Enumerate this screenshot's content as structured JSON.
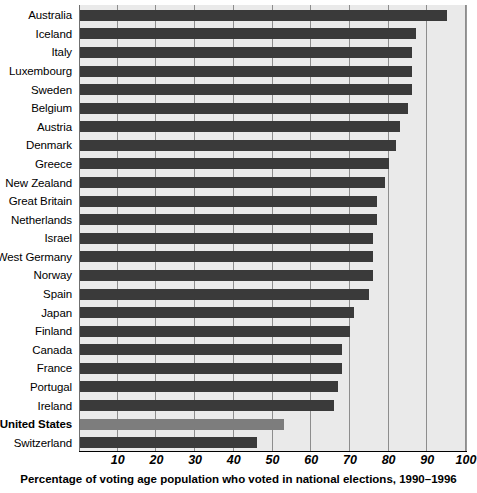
{
  "chart_data": {
    "type": "bar",
    "orientation": "horizontal",
    "title": "",
    "caption": "Percentage of voting age population who voted in national elections, 1990–1996",
    "xlabel": "Percentage of voting age population who voted in national elections, 1990–1996",
    "ylabel": "",
    "xlim": [
      0,
      100
    ],
    "xticks": [
      10,
      20,
      30,
      40,
      50,
      60,
      70,
      80,
      90,
      100
    ],
    "xtick_labels": [
      "10",
      "20",
      "30",
      "40",
      "50",
      "60",
      "70",
      "80",
      "90",
      "100"
    ],
    "grid": "vertical",
    "legend": "none",
    "highlight_category": "United States",
    "categories": [
      "Australia",
      "Iceland",
      "Italy",
      "Luxembourg",
      "Sweden",
      "Belgium",
      "Austria",
      "Denmark",
      "Greece",
      "New Zealand",
      "Great Britain",
      "Netherlands",
      "Israel",
      "West Germany",
      "Norway",
      "Spain",
      "Japan",
      "Finland",
      "Canada",
      "France",
      "Portugal",
      "Ireland",
      "United States",
      "Switzerland"
    ],
    "values": [
      95,
      87,
      86,
      86,
      86,
      85,
      83,
      82,
      80,
      79,
      77,
      77,
      76,
      76,
      76,
      75,
      71,
      70,
      68,
      68,
      67,
      66,
      53,
      46
    ],
    "series": [
      {
        "name": "Voter turnout",
        "values": [
          95,
          87,
          86,
          86,
          86,
          85,
          83,
          82,
          80,
          79,
          77,
          77,
          76,
          76,
          76,
          75,
          71,
          70,
          68,
          68,
          67,
          66,
          53,
          46
        ]
      }
    ]
  },
  "style": {
    "bar_color": "#3a3a3a",
    "highlight_bar_color": "#7d7d7d",
    "plot_background": "#eaeaea",
    "gridline_color": "#8d8d8d",
    "axis_color": "#000000",
    "page_background": "#ffffff"
  }
}
